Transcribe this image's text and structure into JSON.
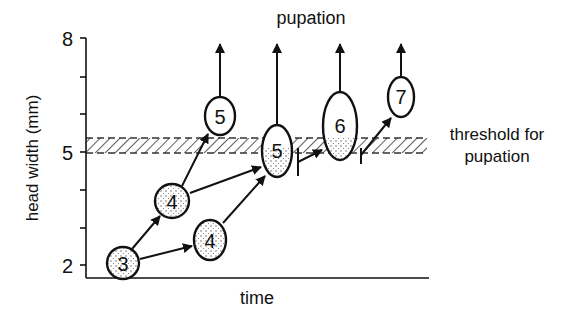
{
  "title": "pupation",
  "threshold_label_line1": "threshold for",
  "threshold_label_line2": "pupation",
  "x_axis_label": "time",
  "y_axis_label": "head width (mm)",
  "y_ticks": [
    {
      "label": "8",
      "y": 38
    },
    {
      "label": "",
      "y": 77
    },
    {
      "label": "",
      "y": 114
    },
    {
      "label": "5",
      "y": 152
    },
    {
      "label": "",
      "y": 190
    },
    {
      "label": "",
      "y": 228
    },
    {
      "label": "2",
      "y": 265
    }
  ],
  "nodes": [
    {
      "id": "n3",
      "label": "3",
      "cx": 123,
      "cy": 263,
      "rx": 16,
      "ry": 16,
      "stipple": "full"
    },
    {
      "id": "n4a",
      "label": "4",
      "cx": 172,
      "cy": 201,
      "rx": 17,
      "ry": 17,
      "stipple": "full"
    },
    {
      "id": "n4b",
      "label": "4",
      "cx": 210,
      "cy": 240,
      "rx": 16,
      "ry": 20,
      "stipple": "full"
    },
    {
      "id": "n5a",
      "label": "5",
      "cx": 220,
      "cy": 116,
      "rx": 15,
      "ry": 19,
      "stipple": "none"
    },
    {
      "id": "n5b",
      "label": "5",
      "cx": 277,
      "cy": 151,
      "rx": 15,
      "ry": 26,
      "stipple": "lower"
    },
    {
      "id": "n6",
      "label": "6",
      "cx": 340,
      "cy": 126,
      "rx": 17,
      "ry": 34,
      "stipple": "bottom"
    },
    {
      "id": "n7",
      "label": "7",
      "cx": 401,
      "cy": 97,
      "rx": 13,
      "ry": 20,
      "stipple": "none"
    }
  ],
  "colors": {
    "ink": "#111111",
    "background": "#ffffff",
    "stipple": "#555555"
  }
}
